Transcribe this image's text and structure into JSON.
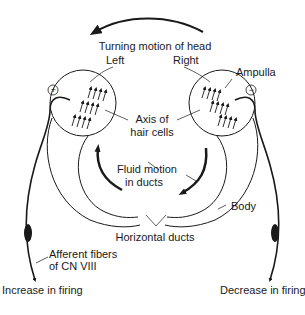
{
  "diagram": {
    "title": "Turning motion of head",
    "side_labels": {
      "left": "Left",
      "right": "Right"
    },
    "labels": {
      "ampulla": "Ampulla",
      "axis_line1": "Axis of",
      "axis_line2": "hair cells",
      "fluid_line1": "Fluid motion",
      "fluid_line2": "in ducts",
      "body": "Body",
      "horizontal_ducts": "Horizontal ducts",
      "afferent_line1": "Afferent fibers",
      "afferent_line2": "of CN VIII",
      "increase": "Increase in firing",
      "decrease": "Decrease in firing"
    },
    "polarity": {
      "left": "+",
      "right": "−"
    },
    "colors": {
      "stroke": "#1a1a1a",
      "background": "#ffffff"
    }
  }
}
